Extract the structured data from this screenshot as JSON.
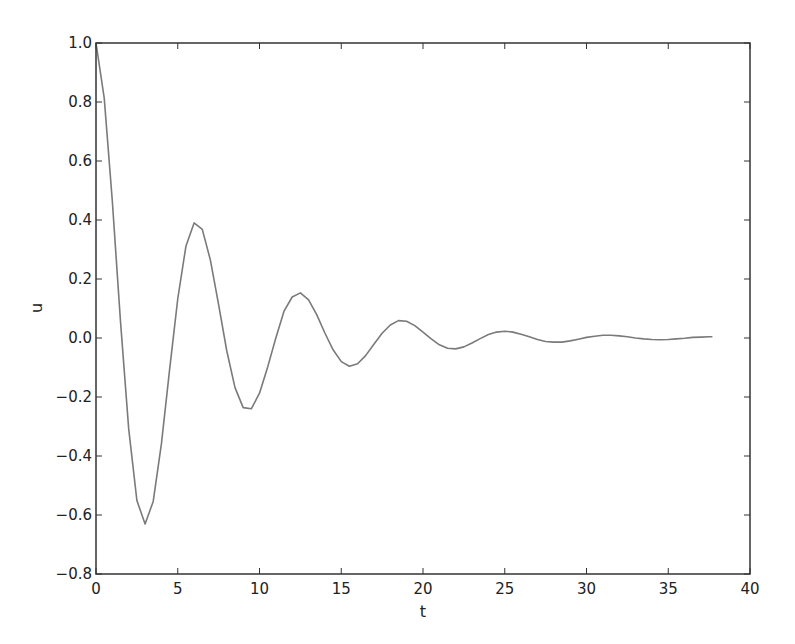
{
  "chart_data": {
    "type": "line",
    "title": "",
    "xlabel": "t",
    "ylabel": "u",
    "xlim": [
      0,
      40
    ],
    "ylim": [
      -0.8,
      1.0
    ],
    "grid": false,
    "legend": null,
    "xticks": [
      "0",
      "5",
      "10",
      "15",
      "20",
      "25",
      "30",
      "35",
      "40"
    ],
    "yticks": [
      "−0.8",
      "−0.6",
      "−0.4",
      "−0.2",
      "0.0",
      "0.2",
      "0.4",
      "0.6",
      "0.8",
      "1.0"
    ],
    "line_color": "#7a7a7a",
    "series": [
      {
        "name": "u(t)",
        "x": [
          0,
          0.5,
          1,
          1.5,
          2,
          2.5,
          3,
          3.5,
          4,
          4.5,
          5,
          5.5,
          6,
          6.5,
          7,
          7.5,
          8,
          8.5,
          9,
          9.5,
          10,
          10.5,
          11,
          11.5,
          12,
          12.5,
          13,
          13.5,
          14,
          14.5,
          15,
          15.5,
          16,
          16.5,
          17,
          17.5,
          18,
          18.5,
          19,
          19.5,
          20,
          20.5,
          21,
          21.5,
          22,
          22.5,
          23,
          23.5,
          24,
          24.5,
          25,
          25.5,
          26,
          26.5,
          27,
          27.5,
          28,
          28.5,
          29,
          29.5,
          30,
          30.5,
          31,
          31.5,
          32,
          32.5,
          33,
          33.5,
          34,
          34.5,
          35,
          35.5,
          36,
          36.5,
          37,
          37.5,
          37.7
        ],
        "values": [
          1.0,
          0.814,
          0.465,
          0.056,
          -0.308,
          -0.551,
          -0.631,
          -0.554,
          -0.359,
          -0.107,
          0.134,
          0.311,
          0.39,
          0.368,
          0.264,
          0.113,
          -0.044,
          -0.168,
          -0.236,
          -0.24,
          -0.187,
          -0.098,
          0.001,
          0.091,
          0.139,
          0.153,
          0.129,
          0.079,
          0.017,
          -0.04,
          -0.08,
          -0.096,
          -0.087,
          -0.059,
          -0.021,
          0.016,
          0.044,
          0.059,
          0.057,
          0.042,
          0.02,
          -0.003,
          -0.023,
          -0.035,
          -0.037,
          -0.03,
          -0.017,
          -0.002,
          0.012,
          0.02,
          0.023,
          0.02,
          0.013,
          0.004,
          -0.005,
          -0.012,
          -0.014,
          -0.014,
          -0.01,
          -0.004,
          0.002,
          0.006,
          0.009,
          0.009,
          0.007,
          0.004,
          0.0,
          -0.003,
          -0.005,
          -0.006,
          -0.005,
          -0.003,
          -0.001,
          0.002,
          0.003,
          0.004,
          0.004
        ]
      }
    ]
  }
}
